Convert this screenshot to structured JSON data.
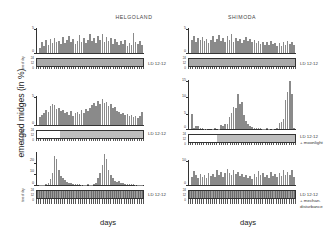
{
  "figure": {
    "ylabel": "emerged midges (in %)",
    "columns": [
      {
        "id": "helgoland",
        "title": "HELGOLAND",
        "xlabel": "days"
      },
      {
        "id": "shimoda",
        "title": "SHIMODA",
        "xlabel": "days"
      }
    ]
  },
  "conditions": {
    "ld": "LD 12:12",
    "ld_moon_line1": "LD 12:12",
    "ld_moon_line2": "+ moonlight",
    "ld_dist_line1": "LD 12:12",
    "ld_dist_line2": "+ mechan.",
    "ld_dist_line3": "disturbance"
  },
  "hour_ticks": [
    "24",
    "12",
    "0"
  ],
  "hour_caption": "time of day",
  "chart_data": [
    {
      "id": "helgoland-ld",
      "type": "bar",
      "title": "HELGOLAND",
      "subtitle": "LD 12:12",
      "xlabel": "days",
      "ylabel": "emerged midges (in %)",
      "ylim": [
        0,
        5
      ],
      "yticks": [
        0,
        5
      ],
      "grid": false,
      "x": [
        1,
        2,
        3,
        4,
        5,
        6,
        7,
        8,
        9,
        10,
        11,
        12,
        13,
        14,
        15,
        16,
        17,
        18,
        19,
        20,
        21,
        22,
        23,
        24,
        25,
        26,
        27,
        28,
        29,
        30,
        31,
        32,
        33,
        34,
        35,
        36,
        37,
        38,
        39,
        40,
        41,
        42,
        43,
        44,
        45,
        46,
        47,
        48,
        49,
        50
      ],
      "values": [
        1.0,
        2.3,
        1.5,
        2.6,
        1.7,
        2.8,
        2.0,
        3.0,
        2.2,
        2.4,
        1.8,
        3.2,
        2.0,
        2.6,
        3.4,
        2.2,
        2.8,
        1.9,
        2.5,
        3.6,
        2.3,
        3.0,
        2.1,
        2.7,
        3.8,
        2.4,
        3.1,
        2.0,
        3.5,
        2.6,
        3.9,
        2.3,
        3.2,
        2.5,
        3.0,
        1.9,
        2.8,
        2.2,
        1.6,
        2.4,
        1.8,
        2.6,
        1.5,
        2.1,
        1.7,
        4.0,
        2.2,
        1.9,
        2.5,
        1.6
      ]
    },
    {
      "id": "shimoda-ld",
      "type": "bar",
      "title": "SHIMODA",
      "subtitle": "LD 12:12",
      "xlabel": "days",
      "ylabel": "emerged midges (in %)",
      "ylim": [
        0,
        5
      ],
      "yticks": [
        0,
        5
      ],
      "grid": false,
      "x": [
        1,
        2,
        3,
        4,
        5,
        6,
        7,
        8,
        9,
        10,
        11,
        12,
        13,
        14,
        15,
        16,
        17,
        18,
        19,
        20,
        21,
        22,
        23,
        24,
        25,
        26,
        27,
        28,
        29,
        30,
        31,
        32,
        33,
        34,
        35,
        36,
        37,
        38,
        39,
        40,
        41,
        42,
        43,
        44,
        45,
        46,
        47,
        48,
        49,
        50
      ],
      "values": [
        2.6,
        3.4,
        2.2,
        3.0,
        2.7,
        3.3,
        2.4,
        2.9,
        2.1,
        2.6,
        3.5,
        2.3,
        2.8,
        3.6,
        2.5,
        3.1,
        2.2,
        3.4,
        2.6,
        3.8,
        2.3,
        3.0,
        2.5,
        2.8,
        2.1,
        2.6,
        3.2,
        2.4,
        2.9,
        2.2,
        2.7,
        2.0,
        2.5,
        1.9,
        2.3,
        1.7,
        2.2,
        1.6,
        2.4,
        1.8,
        2.1,
        1.5,
        2.0,
        1.4,
        2.2,
        1.7,
        2.5,
        1.9,
        2.3,
        1.6
      ]
    },
    {
      "id": "helgoland-moon",
      "type": "bar",
      "title": "HELGOLAND",
      "subtitle": "LD 12:12 + moonlight",
      "xlabel": "days",
      "ylabel": "emerged midges (in %)",
      "ylim": [
        0,
        5
      ],
      "yticks": [
        0,
        5
      ],
      "grid": false,
      "x": [
        1,
        2,
        3,
        4,
        5,
        6,
        7,
        8,
        9,
        10,
        11,
        12,
        13,
        14,
        15,
        16,
        17,
        18,
        19,
        20,
        21,
        22,
        23,
        24,
        25,
        26,
        27,
        28,
        29,
        30,
        31,
        32,
        33,
        34,
        35,
        36,
        37,
        38,
        39,
        40,
        41,
        42,
        43,
        44,
        45,
        46,
        47,
        48,
        49,
        50
      ],
      "values": [
        1.4,
        1.8,
        2.0,
        2.6,
        2.2,
        3.2,
        3.6,
        3.4,
        2.8,
        3.0,
        2.4,
        2.6,
        2.0,
        2.2,
        1.8,
        2.4,
        1.6,
        2.0,
        2.3,
        1.9,
        2.6,
        2.1,
        2.8,
        2.4,
        3.0,
        3.4,
        3.8,
        3.2,
        4.2,
        3.6,
        4.4,
        3.8,
        4.0,
        3.3,
        3.6,
        2.9,
        3.1,
        2.5,
        2.2,
        1.9,
        2.1,
        1.7,
        1.9,
        1.5,
        1.8,
        1.3,
        1.6,
        1.2,
        1.5,
        2.2
      ]
    },
    {
      "id": "shimoda-moon",
      "type": "bar",
      "title": "SHIMODA",
      "subtitle": "LD 12:12 + moonlight",
      "xlabel": "days",
      "ylabel": "emerged midges (in %)",
      "ylim": [
        0,
        15
      ],
      "yticks": [
        0,
        5,
        10,
        15
      ],
      "grid": false,
      "x": [
        1,
        2,
        3,
        4,
        5,
        6,
        7,
        8,
        9,
        10,
        11,
        12,
        13,
        14,
        15,
        16,
        17,
        18,
        19,
        20,
        21,
        22,
        23,
        24,
        25,
        26,
        27,
        28,
        29,
        30,
        31,
        32,
        33,
        34,
        35,
        36,
        37,
        38,
        39,
        40,
        41,
        42,
        43,
        44,
        45,
        46,
        47,
        48,
        49,
        50
      ],
      "values": [
        4.6,
        0.3,
        1.0,
        0.8,
        0.4,
        0.2,
        0.1,
        0.1,
        0.0,
        0.0,
        0.1,
        0.2,
        0.0,
        0.1,
        1.2,
        1.0,
        1.6,
        1.4,
        3.6,
        5.0,
        6.6,
        6.4,
        10.6,
        7.6,
        8.4,
        4.2,
        2.4,
        1.6,
        0.9,
        0.5,
        0.4,
        0.3,
        0.2,
        0.2,
        0.1,
        0.1,
        0.2,
        0.1,
        0.0,
        0.1,
        0.0,
        0.4,
        1.8,
        2.2,
        3.0,
        9.0,
        11.4,
        14.6,
        10.8,
        0.2
      ]
    },
    {
      "id": "helgoland-disturb",
      "type": "bar",
      "title": "HELGOLAND",
      "subtitle": "LD 12:12 + mechan. disturbance",
      "xlabel": "days",
      "ylabel": "emerged midges (in %)",
      "ylim": [
        0,
        30
      ],
      "yticks": [
        0,
        10,
        20
      ],
      "grid": false,
      "x": [
        1,
        2,
        3,
        4,
        5,
        6,
        7,
        8,
        9,
        10,
        11,
        12,
        13,
        14,
        15,
        16,
        17,
        18,
        19,
        20,
        21,
        22,
        23,
        24,
        25,
        26,
        27,
        28,
        29,
        30,
        31,
        32,
        33,
        34,
        35,
        36,
        37,
        38,
        39,
        40,
        41,
        42,
        43,
        44,
        45,
        46,
        47,
        48,
        49,
        50
      ],
      "values": [
        0.2,
        0.3,
        0.2,
        0.5,
        1.6,
        5.4,
        11.0,
        26.0,
        24.0,
        14.0,
        8.0,
        6.0,
        4.4,
        3.0,
        2.0,
        1.4,
        1.0,
        0.8,
        0.6,
        0.5,
        0.4,
        0.4,
        0.3,
        0.6,
        0.4,
        0.3,
        0.5,
        2.0,
        6.0,
        11.0,
        18.0,
        28.0,
        24.0,
        14.0,
        9.0,
        6.0,
        4.0,
        2.6,
        3.6,
        2.2,
        1.6,
        1.2,
        1.0,
        0.8,
        0.6,
        0.5,
        0.4,
        0.3,
        0.3,
        0.2
      ]
    },
    {
      "id": "shimoda-disturb",
      "type": "bar",
      "title": "SHIMODA",
      "subtitle": "LD 12:12 + mechan. disturbance",
      "xlabel": "days",
      "ylabel": "emerged midges (in %)",
      "ylim": [
        0,
        10
      ],
      "yticks": [
        0,
        10
      ],
      "grid": false,
      "x": [
        1,
        2,
        3,
        4,
        5,
        6,
        7,
        8,
        9,
        10,
        11,
        12,
        13,
        14,
        15,
        16,
        17,
        18,
        19,
        20,
        21,
        22,
        23,
        24,
        25,
        26,
        27,
        28,
        29,
        30,
        31,
        32,
        33,
        34,
        35,
        36,
        37,
        38,
        39,
        40,
        41,
        42,
        43,
        44,
        45,
        46,
        47,
        48,
        49,
        50
      ],
      "values": [
        3.2,
        5.6,
        4.0,
        3.0,
        4.6,
        3.4,
        4.2,
        3.0,
        5.0,
        3.6,
        4.4,
        3.2,
        6.2,
        4.0,
        5.4,
        3.4,
        4.8,
        6.6,
        5.0,
        4.2,
        6.0,
        4.6,
        5.2,
        3.8,
        4.4,
        3.2,
        4.0,
        2.8,
        3.6,
        2.6,
        4.6,
        3.2,
        5.6,
        4.0,
        4.8,
        3.4,
        4.2,
        3.0,
        5.2,
        3.8,
        4.4,
        3.2,
        5.0,
        3.6,
        6.2,
        4.2,
        5.4,
        4.0,
        6.0,
        3.4
      ]
    }
  ],
  "regimes": [
    {
      "id": "helgoland-ld-regime",
      "segments": [
        {
          "type": "dark",
          "width": 100
        }
      ]
    },
    {
      "id": "shimoda-ld-regime",
      "segments": [
        {
          "type": "dark",
          "width": 100
        }
      ]
    },
    {
      "id": "helgoland-moon-regime",
      "segments": [
        {
          "type": "light",
          "width": 22
        },
        {
          "type": "moon",
          "width": 78
        }
      ]
    },
    {
      "id": "shimoda-moon-regime",
      "segments": [
        {
          "type": "light",
          "width": 26
        },
        {
          "type": "moon",
          "width": 74
        }
      ]
    },
    {
      "id": "helgoland-disturb-regime",
      "segments": [
        {
          "type": "dist",
          "width": 100
        }
      ]
    },
    {
      "id": "shimoda-disturb-regime",
      "segments": [
        {
          "type": "dist",
          "width": 100
        }
      ]
    }
  ]
}
